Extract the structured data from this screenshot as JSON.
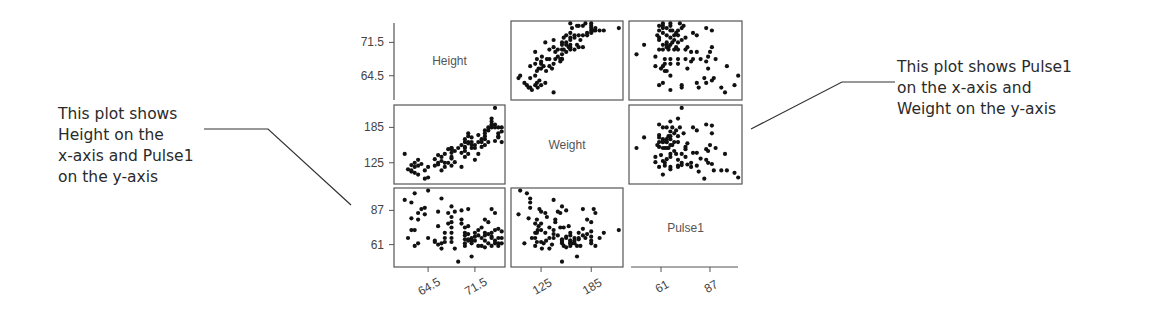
{
  "chart_data": {
    "type": "scatter",
    "subtype": "scatterplot-matrix",
    "title": "",
    "variables": [
      "Height",
      "Weight",
      "Pulse1"
    ],
    "axes": {
      "Height": {
        "ticks": [
          64.5,
          71.5
        ],
        "tick_labels": [
          "64.5",
          "71.5"
        ],
        "range": [
          59.4,
          76.0
        ]
      },
      "Weight": {
        "ticks": [
          125,
          185
        ],
        "tick_labels": [
          "125",
          "185"
        ],
        "range": [
          89,
          223
        ]
      },
      "Pulse1": {
        "ticks": [
          61,
          87
        ],
        "tick_labels": [
          "61",
          "87"
        ],
        "range": [
          44,
          104
        ]
      }
    },
    "diagonal_labels": [
      "Height",
      "Weight",
      "Pulse1"
    ],
    "grid": false,
    "legend": "none",
    "observations": [
      [
        61.0,
        140,
        95
      ],
      [
        62.0,
        112,
        93
      ],
      [
        62.5,
        108,
        100
      ],
      [
        62.5,
        118,
        60
      ],
      [
        62.5,
        125,
        72
      ],
      [
        62.0,
        121,
        72
      ],
      [
        61.5,
        114,
        66
      ],
      [
        63.0,
        130,
        85
      ],
      [
        63.0,
        120,
        80
      ],
      [
        63.0,
        105,
        62
      ],
      [
        63.5,
        123,
        88
      ],
      [
        64.0,
        98,
        84
      ],
      [
        64.0,
        112,
        89
      ],
      [
        64.5,
        118,
        66
      ],
      [
        65.5,
        120,
        63
      ],
      [
        65.5,
        131,
        64
      ],
      [
        66.0,
        125,
        86
      ],
      [
        66.0,
        122,
        75
      ],
      [
        66.0,
        138,
        61
      ],
      [
        66.5,
        128,
        62
      ],
      [
        66.5,
        135,
        58
      ],
      [
        67.0,
        118,
        70
      ],
      [
        67.0,
        140,
        66
      ],
      [
        67.0,
        125,
        63
      ],
      [
        67.5,
        148,
        85
      ],
      [
        67.5,
        125,
        77
      ],
      [
        68.0,
        150,
        90
      ],
      [
        68.0,
        132,
        82
      ],
      [
        68.0,
        142,
        78
      ],
      [
        68.0,
        148,
        74
      ],
      [
        68.0,
        120,
        70
      ],
      [
        68.0,
        135,
        66
      ],
      [
        68.0,
        150,
        63
      ],
      [
        68.5,
        126,
        58
      ],
      [
        69.0,
        150,
        48
      ],
      [
        69.5,
        155,
        87
      ],
      [
        69.5,
        142,
        80
      ],
      [
        69.5,
        118,
        77
      ],
      [
        70.0,
        135,
        74
      ],
      [
        70.0,
        160,
        70
      ],
      [
        70.0,
        145,
        68
      ],
      [
        70.0,
        150,
        65
      ],
      [
        70.0,
        165,
        62
      ],
      [
        70.0,
        152,
        60
      ],
      [
        70.5,
        175,
        88
      ],
      [
        70.5,
        158,
        75
      ],
      [
        70.5,
        140,
        69
      ],
      [
        70.5,
        170,
        65
      ],
      [
        70.5,
        160,
        64
      ],
      [
        71.0,
        150,
        62
      ],
      [
        71.0,
        155,
        66
      ],
      [
        71.0,
        160,
        64
      ],
      [
        71.0,
        168,
        52
      ],
      [
        71.5,
        130,
        70
      ],
      [
        71.5,
        150,
        64
      ],
      [
        71.5,
        155,
        67
      ],
      [
        72.0,
        140,
        72
      ],
      [
        72.0,
        160,
        68
      ],
      [
        72.0,
        172,
        60
      ],
      [
        72.5,
        152,
        74
      ],
      [
        72.5,
        165,
        66
      ],
      [
        72.5,
        160,
        60
      ],
      [
        73.0,
        180,
        80
      ],
      [
        73.0,
        170,
        70
      ],
      [
        73.0,
        175,
        68
      ],
      [
        73.0,
        165,
        64
      ],
      [
        73.0,
        155,
        59
      ],
      [
        73.5,
        185,
        78
      ],
      [
        73.5,
        180,
        69
      ],
      [
        73.5,
        160,
        62
      ],
      [
        74.0,
        200,
        70
      ],
      [
        74.0,
        195,
        66
      ],
      [
        74.0,
        190,
        60
      ],
      [
        74.0,
        185,
        67
      ],
      [
        74.0,
        188,
        88
      ],
      [
        74.5,
        190,
        85
      ],
      [
        74.5,
        185,
        64
      ],
      [
        74.5,
        162,
        62
      ],
      [
        75.0,
        175,
        73
      ],
      [
        75.0,
        170,
        66
      ],
      [
        75.0,
        168,
        60
      ],
      [
        75.0,
        185,
        62
      ],
      [
        75.5,
        185,
        71
      ],
      [
        75.5,
        160,
        62
      ],
      [
        75.5,
        178,
        66
      ],
      [
        74.5,
        218,
        72
      ],
      [
        68.5,
        145,
        86
      ],
      [
        66.5,
        112,
        96
      ],
      [
        64.5,
        100,
        102
      ],
      [
        62.0,
        110,
        81
      ]
    ]
  },
  "annotations": {
    "left": {
      "text": "This plot shows\nHeight on the\nx-axis and Pulse1\non the y-axis",
      "points_to": "Height (x) vs Pulse1 (y) panel, row 3 column 1"
    },
    "right": {
      "text": "This plot shows Pulse1\non the x-axis and\nWeight on the y-axis",
      "points_to": "Pulse1 (x) vs Weight (y) panel, row 2 column 3"
    }
  },
  "colors": {
    "frame": "#555555",
    "point": "#111111",
    "tick_label": "#444444",
    "diag_label": "#555555",
    "annotation_text": "#2a2a2a",
    "leader": "#333333"
  }
}
